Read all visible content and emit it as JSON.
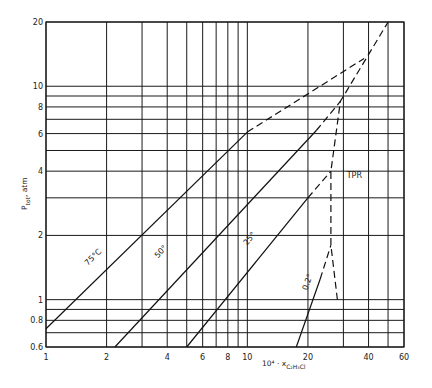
{
  "chart_data": {
    "type": "line",
    "title": "",
    "xlabel": "10⁴ · x",
    "xlabel_sub": "C₂H₃Cl",
    "ylabel": "P",
    "ylabel_sub": "tot",
    "ylabel_suffix": ", atm",
    "xscale": "log",
    "yscale": "log",
    "xlim": [
      1,
      60
    ],
    "ylim": [
      0.6,
      20
    ],
    "grid": true,
    "x_gridlines": [
      1,
      2,
      3,
      4,
      5,
      6,
      7,
      8,
      9,
      10,
      20,
      30,
      40,
      50,
      60
    ],
    "y_gridlines": [
      0.6,
      0.7,
      0.8,
      0.9,
      1,
      2,
      3,
      4,
      5,
      6,
      7,
      8,
      9,
      10,
      20
    ],
    "x_ticks": [
      {
        "value": 1,
        "label": "1"
      },
      {
        "value": 2,
        "label": "2"
      },
      {
        "value": 4,
        "label": "4"
      },
      {
        "value": 6,
        "label": "6"
      },
      {
        "value": 8,
        "label": "8"
      },
      {
        "value": 10,
        "label": "10"
      },
      {
        "value": 20,
        "label": "20"
      },
      {
        "value": 40,
        "label": "40"
      },
      {
        "value": 60,
        "label": "60"
      }
    ],
    "y_ticks": [
      {
        "value": 0.6,
        "label": "0.6"
      },
      {
        "value": 0.8,
        "label": "0.8"
      },
      {
        "value": 1,
        "label": "1"
      },
      {
        "value": 2,
        "label": "2"
      },
      {
        "value": 4,
        "label": "4"
      },
      {
        "value": 6,
        "label": "6"
      },
      {
        "value": 8,
        "label": "8"
      },
      {
        "value": 10,
        "label": "10"
      },
      {
        "value": 20,
        "label": "20"
      }
    ],
    "series": [
      {
        "name": "75°C",
        "label": "75°C",
        "solid": [
          [
            1,
            0.73
          ],
          [
            10,
            6.1
          ]
        ],
        "dashed": [
          [
            10,
            6.1
          ],
          [
            38,
            13.5
          ]
        ],
        "label_at": [
          1.75,
          1.55
        ]
      },
      {
        "name": "50°",
        "label": "50°",
        "solid": [
          [
            2.2,
            0.6
          ],
          [
            22,
            6.2
          ]
        ],
        "dashed": [
          [
            22,
            6.2
          ],
          [
            29,
            8.5
          ]
        ],
        "label_at": [
          3.8,
          1.65
        ]
      },
      {
        "name": "25°",
        "label": "25°",
        "solid": [
          [
            5,
            0.6
          ],
          [
            20,
            3.0
          ]
        ],
        "dashed": [
          [
            20,
            3.0
          ],
          [
            26,
            4.0
          ]
        ],
        "label_at": [
          10.5,
          1.9
        ]
      },
      {
        "name": "0.2°",
        "label": "0.2°",
        "solid": [
          [
            17.5,
            0.6
          ],
          [
            23,
            1.25
          ]
        ],
        "dashed": [
          [
            23,
            1.25
          ],
          [
            26,
            1.8
          ]
        ],
        "label_at": [
          20.5,
          1.2
        ]
      },
      {
        "name": "TPR",
        "label": "TPR",
        "solid": [],
        "dashed": [
          [
            28,
            1.0
          ],
          [
            26,
            1.8
          ],
          [
            26,
            4.0
          ],
          [
            29,
            8.5
          ],
          [
            50,
            20
          ]
        ],
        "label_at": [
          34,
          3.7
        ]
      }
    ]
  }
}
